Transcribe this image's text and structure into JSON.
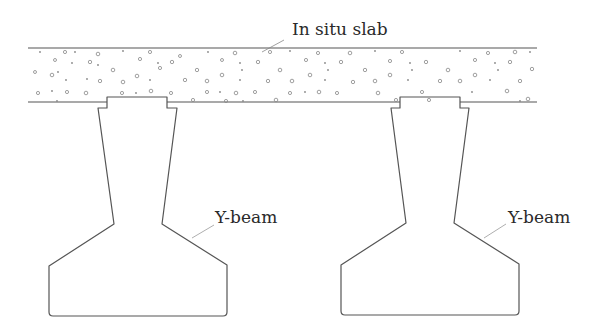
{
  "diagram": {
    "type": "structural cross-section",
    "labels": {
      "slab": "In situ slab",
      "beam_left": "Y-beam",
      "beam_right": "Y-beam"
    },
    "components": [
      {
        "name": "In situ slab",
        "kind": "concrete slab with aggregate hatch"
      },
      {
        "name": "Y-beam",
        "kind": "precast beam",
        "position": "left"
      },
      {
        "name": "Y-beam",
        "kind": "precast beam",
        "position": "right"
      }
    ],
    "colors": {
      "line": "#555555",
      "text": "#2a2a2a",
      "background": "#ffffff"
    }
  }
}
